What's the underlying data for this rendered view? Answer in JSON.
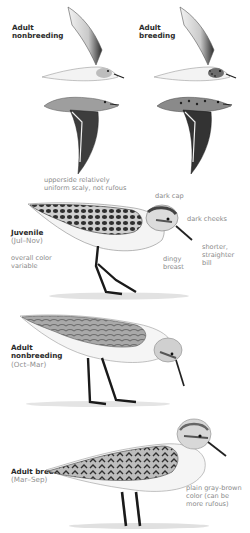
{
  "top_caption": "",
  "plates": {
    "flight_left": {
      "title_line1": "Adult",
      "title_line2": "nonbreeding"
    },
    "flight_right": {
      "title_line1": "Adult",
      "title_line2": "breeding"
    },
    "juvenile": {
      "title": "Juvenile",
      "season": "(Jul–Nov)",
      "notes": {
        "upperside_l1": "upperside relatively",
        "upperside_l2": "uniform scaly, not rufous",
        "cap": "dark cap",
        "cheeks": "dark cheeks",
        "color_l1": "overall color",
        "color_l2": "variable",
        "breast_l1": "dingy",
        "breast_l2": "breast",
        "bill_l1": "shorter,",
        "bill_l2": "straighter",
        "bill_l3": "bill"
      }
    },
    "adult_nonbreeding": {
      "title_line1": "Adult",
      "title_line2": "nonbreeding",
      "season": "(Oct–Mar)"
    },
    "adult_breeding": {
      "title": "Adult breeding",
      "season": "(Mar–Sep)",
      "notes": {
        "color_l1": "plain gray-brown",
        "color_l2": "color (can be",
        "color_l3": "more rufous)"
      }
    }
  },
  "colors": {
    "ink": "#2b2b2b",
    "note_gray": "#8a8a8a",
    "plumage_dark": "#3a3a3a",
    "plumage_mid": "#8c8c8c",
    "plumage_light": "#d6d6d6"
  }
}
